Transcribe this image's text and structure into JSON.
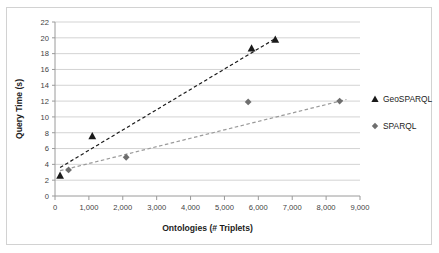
{
  "chart_data": {
    "type": "scatter",
    "title": "",
    "xlabel": "Ontologies (# Triplets)",
    "ylabel": "Query Time (s)",
    "xlim": [
      0,
      9000
    ],
    "ylim": [
      0,
      22
    ],
    "xticks": [
      0,
      1000,
      2000,
      3000,
      4000,
      5000,
      6000,
      7000,
      8000,
      9000
    ],
    "xtick_labels": [
      "0",
      "1,000",
      "2,000",
      "3,000",
      "4,000",
      "5,000",
      "6,000",
      "7,000",
      "8,000",
      "9,000"
    ],
    "yticks": [
      0,
      2,
      4,
      6,
      8,
      10,
      12,
      14,
      16,
      18,
      20,
      22
    ],
    "ytick_labels": [
      "0",
      "2",
      "4",
      "6",
      "8",
      "10",
      "12",
      "14",
      "16",
      "18",
      "20",
      "22"
    ],
    "grid": "horizontal",
    "legend_position": "right-outside",
    "series": [
      {
        "name": "GeoSPARQL",
        "marker": "triangle",
        "color": "#1a1a1a",
        "trendline": "dashed",
        "trendline_color": "#1a1a1a",
        "points": [
          {
            "x": 150,
            "y": 2.6
          },
          {
            "x": 1100,
            "y": 7.6
          },
          {
            "x": 5800,
            "y": 18.7
          },
          {
            "x": 6500,
            "y": 19.8
          }
        ],
        "trendline_endpoints": [
          {
            "x": 150,
            "y": 3.6
          },
          {
            "x": 6500,
            "y": 19.9
          }
        ]
      },
      {
        "name": "SPARQL",
        "marker": "diamond",
        "color": "#6e6e6e",
        "trendline": "dashed",
        "trendline_color": "#9a9a9a",
        "points": [
          {
            "x": 400,
            "y": 3.3
          },
          {
            "x": 2100,
            "y": 4.9
          },
          {
            "x": 5700,
            "y": 11.9
          },
          {
            "x": 8400,
            "y": 12.0
          }
        ],
        "trendline_endpoints": [
          {
            "x": 150,
            "y": 3.2
          },
          {
            "x": 8600,
            "y": 12.2
          }
        ]
      }
    ]
  },
  "legend": {
    "items": [
      {
        "label": "GeoSPARQL",
        "marker": "triangle-icon"
      },
      {
        "label": "SPARQL",
        "marker": "diamond-icon"
      }
    ]
  },
  "colors": {
    "geosparql": "#1a1a1a",
    "sparql": "#6e6e6e",
    "gridline": "#c8c8c8",
    "axis": "#9a9a9a",
    "frame": "#d2d2d2",
    "text": "#1c1c1c"
  }
}
